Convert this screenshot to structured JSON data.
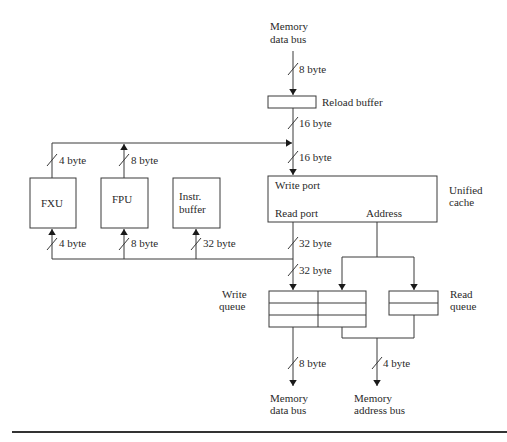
{
  "diagram": {
    "colors": {
      "line": "#3a3a3a",
      "text": "#2a2a2a",
      "background": "#ffffff"
    },
    "blocks": {
      "reload_buffer": {
        "label": "Reload buffer"
      },
      "fxu": {
        "label": "FXU"
      },
      "fpu": {
        "label": "FPU"
      },
      "instr_buffer": {
        "label_line1": "Instr.",
        "label_line2": "buffer"
      },
      "unified_cache": {
        "label_line1": "Unified",
        "label_line2": "cache",
        "write_port": "Write port",
        "read_port": "Read port",
        "address": "Address"
      },
      "write_queue": {
        "label_line1": "Write",
        "label_line2": "queue"
      },
      "read_queue": {
        "label_line1": "Read",
        "label_line2": "queue"
      }
    },
    "terminals": {
      "memory_data_bus_top": {
        "line1": "Memory",
        "line2": "data bus"
      },
      "memory_data_bus_bottom": {
        "line1": "Memory",
        "line2": "data bus"
      },
      "memory_address_bus": {
        "line1": "Memory",
        "line2": "address bus"
      }
    },
    "bus_widths": {
      "mem_to_reload": "8 byte",
      "reload_to_bus": "16 byte",
      "bus_to_cache": "16 byte",
      "fxu_out": "4 byte",
      "fpu_out": "8 byte",
      "fxu_in": "4 byte",
      "fpu_in": "8 byte",
      "instr_in": "32 byte",
      "read_port_out": "32 byte",
      "to_write_queue": "32 byte",
      "write_queue_to_mem": "8 byte",
      "to_address_bus": "4 byte"
    }
  }
}
